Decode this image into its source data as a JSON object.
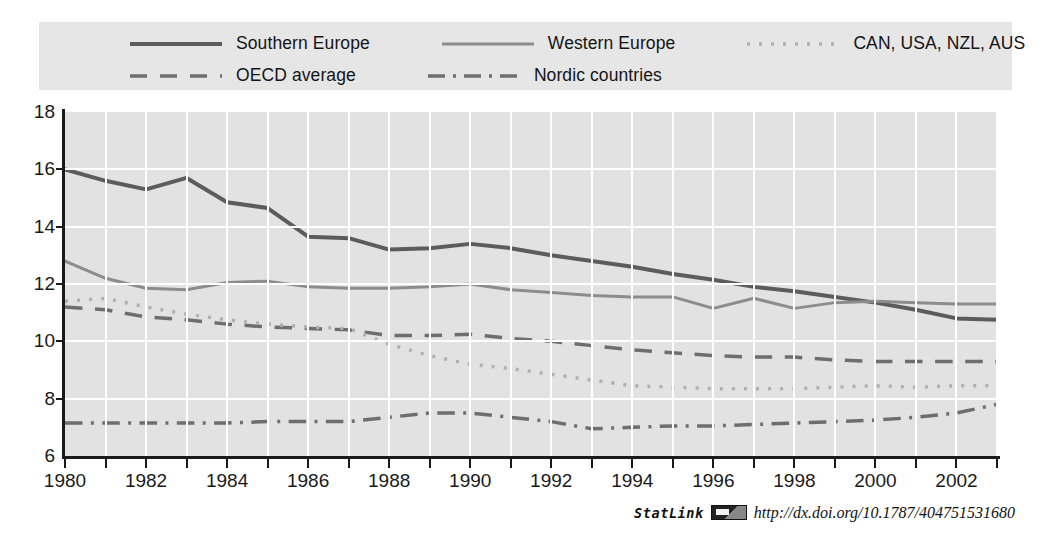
{
  "chart_data": {
    "type": "line",
    "title": "",
    "xlabel": "",
    "ylabel": "",
    "xlim": [
      1980,
      2003
    ],
    "ylim": [
      6,
      18
    ],
    "yticks": [
      6,
      8,
      10,
      12,
      14,
      16,
      18
    ],
    "xticks": [
      1980,
      1981,
      1982,
      1983,
      1984,
      1985,
      1986,
      1987,
      1988,
      1989,
      1990,
      1991,
      1992,
      1993,
      1994,
      1995,
      1996,
      1997,
      1998,
      1999,
      2000,
      2001,
      2002,
      2003
    ],
    "xtick_labels": [
      "1980",
      "1982",
      "1984",
      "1986",
      "1988",
      "1990",
      "1992",
      "1994",
      "1996",
      "1998",
      "2000",
      "2002"
    ],
    "xtick_label_values": [
      1980,
      1982,
      1984,
      1986,
      1988,
      1990,
      1992,
      1994,
      1996,
      1998,
      2000,
      2002
    ],
    "grid": true,
    "legend_position": "top",
    "x": [
      1980,
      1981,
      1982,
      1983,
      1984,
      1985,
      1986,
      1987,
      1988,
      1989,
      1990,
      1991,
      1992,
      1993,
      1994,
      1995,
      1996,
      1997,
      1998,
      1999,
      2000,
      2001,
      2002,
      2003
    ],
    "series": [
      {
        "name": "Southern Europe",
        "style": "solid",
        "color": "#5c5c5c",
        "width": 4.0,
        "values": [
          16.0,
          15.6,
          15.3,
          15.7,
          14.85,
          14.65,
          13.65,
          13.6,
          13.2,
          13.25,
          13.4,
          13.25,
          13.0,
          12.8,
          12.6,
          12.35,
          12.15,
          11.9,
          11.75,
          11.55,
          11.35,
          11.1,
          10.8,
          10.75
        ]
      },
      {
        "name": "Western Europe",
        "style": "solid",
        "color": "#8c8c8c",
        "width": 3.0,
        "values": [
          12.8,
          12.2,
          11.85,
          11.8,
          12.05,
          12.1,
          11.9,
          11.85,
          11.85,
          11.9,
          12.0,
          11.8,
          11.7,
          11.6,
          11.55,
          11.55,
          11.15,
          11.5,
          11.15,
          11.35,
          11.4,
          11.35,
          11.3,
          11.3
        ]
      },
      {
        "name": "OECD average",
        "style": "dashed",
        "color": "#6e6e6e",
        "width": 3.5,
        "values": [
          11.2,
          11.1,
          10.85,
          10.75,
          10.6,
          10.5,
          10.45,
          10.4,
          10.2,
          10.2,
          10.25,
          10.1,
          10.0,
          9.85,
          9.7,
          9.6,
          9.5,
          9.45,
          9.45,
          9.35,
          9.3,
          9.3,
          9.3,
          9.3
        ]
      },
      {
        "name": "Nordic countries",
        "style": "dashdot",
        "color": "#6e6e6e",
        "width": 3.5,
        "values": [
          7.15,
          7.15,
          7.15,
          7.15,
          7.15,
          7.2,
          7.2,
          7.2,
          7.35,
          7.5,
          7.5,
          7.35,
          7.2,
          6.95,
          7.0,
          7.05,
          7.05,
          7.1,
          7.15,
          7.2,
          7.25,
          7.35,
          7.5,
          7.8
        ]
      },
      {
        "name": "CAN, USA, NZL, AUS",
        "style": "dotted",
        "color": "#b0b0b0",
        "width": 3.5,
        "values": [
          11.4,
          11.5,
          11.2,
          10.95,
          10.75,
          10.6,
          10.5,
          10.45,
          9.9,
          9.5,
          9.2,
          9.05,
          8.85,
          8.65,
          8.45,
          8.4,
          8.35,
          8.35,
          8.35,
          8.4,
          8.45,
          8.4,
          8.45,
          8.45
        ]
      }
    ]
  },
  "legend": {
    "rows": [
      [
        {
          "label": "Southern Europe",
          "series": 0
        },
        {
          "label": "Western Europe",
          "series": 1
        },
        {
          "label": "CAN, USA, NZL, AUS",
          "series": 4
        }
      ],
      [
        {
          "label": "OECD average",
          "series": 2
        },
        {
          "label": "Nordic countries",
          "series": 3
        }
      ]
    ]
  },
  "statlink": {
    "name": "StatLink",
    "icon": "statlink-barcode-icon",
    "url": "http://dx.doi.org/10.1787/404751531680"
  }
}
